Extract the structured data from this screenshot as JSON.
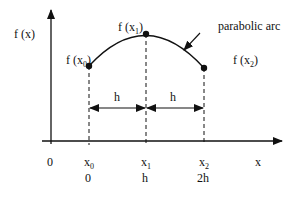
{
  "diagram": {
    "y_axis_label": "f (x)",
    "x_axis_label": "x",
    "origin_label": "0",
    "annotation": "parabolic arc",
    "points": [
      {
        "label": "f (x",
        "sub": "0",
        "close": ")",
        "x_label": "x",
        "x_sub": "0",
        "value_label": "0"
      },
      {
        "label": "f (x",
        "sub": "1",
        "close": ")",
        "x_label": "x",
        "x_sub": "1",
        "value_label": "h"
      },
      {
        "label": "f (x",
        "sub": "2",
        "close": ")",
        "x_label": "x",
        "x_sub": "2",
        "value_label": "2h"
      }
    ],
    "intervals": [
      {
        "label": "h"
      },
      {
        "label": "h"
      }
    ]
  }
}
